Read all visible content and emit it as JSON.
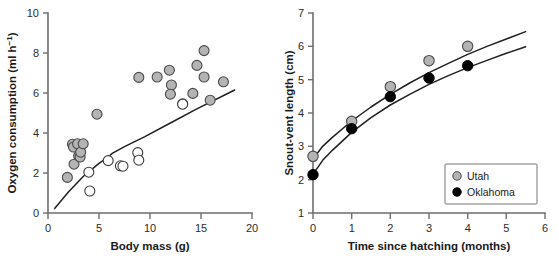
{
  "figure": {
    "title": "",
    "background": "#ffffff",
    "marker_gray": "#b4b4b4",
    "marker_black": "#000000",
    "marker_open": "#ffffff",
    "axis_color": "#6e6e6e",
    "line_color": "#1f1f1f"
  },
  "chart_data": [
    {
      "type": "scatter",
      "panel": "left",
      "title": "",
      "xlabel": "Body mass (g)",
      "ylabel": "Oxygen consumption (ml h−1)",
      "ylabel_base": "Oxygen consumption (ml h",
      "ylabel_sup": "−1",
      "ylabel_tail": ")",
      "xlim": [
        0,
        20
      ],
      "ylim": [
        0,
        10
      ],
      "xticks": [
        0,
        5,
        10,
        15,
        20
      ],
      "yticks": [
        0,
        2,
        4,
        6,
        8,
        10
      ],
      "xticklabels": [
        "0",
        "5",
        "10",
        "15",
        "20"
      ],
      "yticklabels": [
        "0",
        "2",
        "4",
        "6",
        "8",
        "10"
      ],
      "grid": false,
      "legend": "none",
      "series": [
        {
          "name": "gray-filled",
          "marker": "filled-gray-circle",
          "points": [
            [
              1.9,
              1.78
            ],
            [
              2.4,
              3.44
            ],
            [
              2.5,
              3.3
            ],
            [
              2.55,
              2.44
            ],
            [
              2.9,
              3.46
            ],
            [
              3.0,
              2.86
            ],
            [
              3.15,
              2.8
            ],
            [
              3.2,
              3.04
            ],
            [
              3.45,
              3.46
            ],
            [
              4.8,
              4.94
            ],
            [
              8.9,
              6.78
            ],
            [
              10.7,
              6.8
            ],
            [
              11.9,
              7.14
            ],
            [
              12.1,
              6.4
            ],
            [
              12.0,
              5.94
            ],
            [
              13.2,
              5.46
            ],
            [
              14.2,
              5.98
            ],
            [
              14.6,
              7.38
            ],
            [
              15.3,
              8.12
            ],
            [
              15.3,
              6.8
            ],
            [
              15.9,
              5.64
            ],
            [
              17.2,
              6.56
            ]
          ]
        },
        {
          "name": "open",
          "marker": "open-circle",
          "points": [
            [
              4.0,
              2.04
            ],
            [
              4.1,
              1.1
            ],
            [
              5.9,
              2.62
            ],
            [
              7.1,
              2.36
            ],
            [
              7.35,
              2.34
            ],
            [
              8.8,
              3.02
            ],
            [
              8.9,
              2.64
            ],
            [
              13.2,
              5.44
            ]
          ]
        }
      ],
      "fit_line": {
        "name": "regression",
        "points": [
          [
            0.65,
            0.22
          ],
          [
            2.0,
            1.05
          ],
          [
            3.5,
            1.85
          ],
          [
            5.0,
            2.48
          ],
          [
            5.9,
            2.8
          ],
          [
            6.3,
            2.98
          ],
          [
            7.5,
            3.32
          ],
          [
            9.5,
            3.82
          ],
          [
            12.0,
            4.5
          ],
          [
            14.5,
            5.18
          ],
          [
            18.3,
            6.15
          ]
        ]
      }
    },
    {
      "type": "scatter",
      "panel": "right",
      "title": "",
      "xlabel": "Time since hatching (months)",
      "ylabel": "Snout-vent length (cm)",
      "xlim": [
        0,
        6
      ],
      "ylim": [
        1,
        7
      ],
      "xticks": [
        0,
        1,
        2,
        3,
        4,
        5,
        6
      ],
      "yticks": [
        1,
        2,
        3,
        4,
        5,
        6,
        7
      ],
      "xticklabels": [
        "0",
        "1",
        "2",
        "3",
        "4",
        "5",
        "6"
      ],
      "yticklabels": [
        "1",
        "2",
        "3",
        "4",
        "5",
        "6",
        "7"
      ],
      "grid": false,
      "legend": "lower-right",
      "series": [
        {
          "name": "Utah",
          "marker": "filled-gray-circle",
          "x": [
            0,
            1,
            2,
            3,
            4
          ],
          "values": [
            2.7,
            3.75,
            4.79,
            5.57,
            6.0
          ]
        },
        {
          "name": "Oklahoma",
          "marker": "filled-black-circle",
          "x": [
            0,
            1,
            2,
            3,
            4
          ],
          "values": [
            2.15,
            3.53,
            4.49,
            5.05,
            5.42
          ]
        }
      ],
      "fit_curves": [
        {
          "name": "Utah curve",
          "points": [
            [
              0.0,
              2.62
            ],
            [
              0.25,
              3.0
            ],
            [
              0.5,
              3.27
            ],
            [
              1.0,
              3.76
            ],
            [
              1.5,
              4.18
            ],
            [
              2.0,
              4.56
            ],
            [
              2.5,
              4.9
            ],
            [
              3.0,
              5.21
            ],
            [
              3.5,
              5.49
            ],
            [
              4.0,
              5.76
            ],
            [
              4.5,
              6.0
            ],
            [
              5.0,
              6.22
            ],
            [
              5.5,
              6.44
            ]
          ]
        },
        {
          "name": "Oklahoma curve",
          "points": [
            [
              0.0,
              2.16
            ],
            [
              0.25,
              2.58
            ],
            [
              0.5,
              2.88
            ],
            [
              1.0,
              3.42
            ],
            [
              1.5,
              3.86
            ],
            [
              2.0,
              4.24
            ],
            [
              2.5,
              4.56
            ],
            [
              3.0,
              4.86
            ],
            [
              3.5,
              5.12
            ],
            [
              4.0,
              5.36
            ],
            [
              4.5,
              5.58
            ],
            [
              5.0,
              5.79
            ],
            [
              5.5,
              5.99
            ]
          ]
        }
      ],
      "legend_entries": [
        {
          "label": "Utah",
          "marker": "filled-gray-circle"
        },
        {
          "label": "Oklahoma",
          "marker": "filled-black-circle"
        }
      ]
    }
  ]
}
